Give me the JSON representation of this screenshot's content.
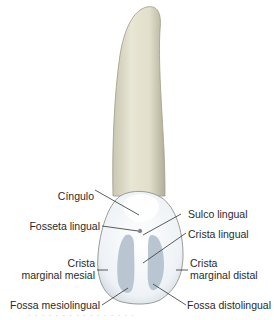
{
  "figure": {
    "colors": {
      "root": "#e4e2cf",
      "root_shadow": "#bdbba6",
      "crown": "#f4f7fa",
      "fossa": "#b7c3d0",
      "outline": "#8a8a80",
      "leader_line": "#333333"
    },
    "labels": {
      "cingulo": "Cíngulo",
      "fosseta_lingual": "Fosseta lingual",
      "crista_marginal_mesial_1": "Crista",
      "crista_marginal_mesial_2": "marginal mesial",
      "fossa_mesiolingual": "Fossa mesiolingual",
      "sulco_lingual": "Sulco lingual",
      "crista_lingual": "Crista lingual",
      "crista_marginal_distal_1": "Crista",
      "crista_marginal_distal_2": "marginal distal",
      "fossa_distolingual": "Fossa distolingual"
    },
    "caption": "· · · · · · · · · · · · · · · ·"
  }
}
